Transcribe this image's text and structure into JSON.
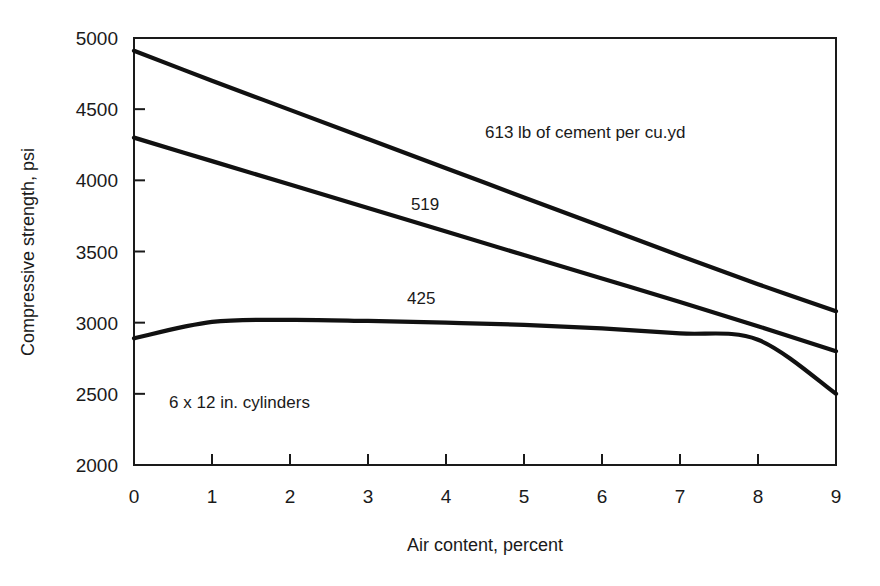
{
  "chart_data": {
    "type": "line",
    "title": "",
    "xlabel": "Air content, percent",
    "ylabel": "Compressive strength, psi",
    "xlim": [
      0,
      9
    ],
    "ylim": [
      2000,
      5000
    ],
    "grid": false,
    "legend_position": "inline-annotations",
    "x_ticks": [
      "0",
      "1",
      "2",
      "3",
      "4",
      "5",
      "6",
      "7",
      "8",
      "9"
    ],
    "y_ticks": [
      "2000",
      "2500",
      "3000",
      "3500",
      "4000",
      "4500",
      "5000"
    ],
    "x": [
      0,
      1,
      2,
      3,
      4,
      5,
      6,
      7,
      8,
      9
    ],
    "series": [
      {
        "name": "613",
        "label": "613 lb of cement per cu.yd",
        "values": [
          4910,
          4700,
          4495,
          4290,
          4085,
          3880,
          3675,
          3470,
          3270,
          3080
        ]
      },
      {
        "name": "519",
        "label": "519",
        "values": [
          4300,
          4135,
          3970,
          3805,
          3640,
          3475,
          3310,
          3145,
          2975,
          2800
        ]
      },
      {
        "name": "425",
        "label": "425",
        "values": [
          2890,
          3005,
          3020,
          3012,
          3000,
          2985,
          2960,
          2925,
          2880,
          2500
        ]
      }
    ],
    "annotations": [
      {
        "id": "series-613-label",
        "text": "613 lb of cement per cu.yd",
        "x": 4.5,
        "y": 4300
      },
      {
        "id": "series-519-label",
        "text": "519",
        "x": 3.55,
        "y": 3790
      },
      {
        "id": "series-425-label",
        "text": "425",
        "x": 3.5,
        "y": 3130
      },
      {
        "id": "specimen-note",
        "text": "6 x 12 in. cylinders",
        "x": 0.45,
        "y": 2400
      }
    ],
    "colors": {
      "curve": "#111111",
      "axis": "#1a1a1a",
      "background": "#ffffff",
      "text": "#1a1a1a"
    }
  }
}
